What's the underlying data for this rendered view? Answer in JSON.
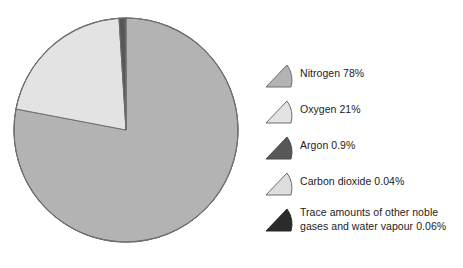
{
  "chart_data": {
    "type": "pie",
    "title": "",
    "subtitle": "",
    "xlabel": "",
    "ylabel": "",
    "grid": false,
    "legend_position": "right",
    "start_angle_deg": 0,
    "direction": "clockwise",
    "units": "%",
    "categories": [
      "Nitrogen",
      "Oxygen",
      "Argon",
      "Carbon dioxide",
      "Trace amounts of other noble gases and water vapour"
    ],
    "values": [
      78,
      21,
      0.9,
      0.04,
      0.06
    ],
    "labels": [
      "Nitrogen 78%",
      "Oxygen 21%",
      "Argon 0.9%",
      "Carbon dioxide 0.04%",
      "Trace amounts of other noble\ngases and water vapour 0.06%"
    ],
    "colors": [
      "#b3b3b3",
      "#e3e3e3",
      "#575757",
      "#dedede",
      "#2b2b2b"
    ],
    "stroke_color": "#6e6e6e",
    "background": "#ffffff"
  },
  "pie": {
    "center_x": 118,
    "center_y": 118,
    "radius": 112,
    "outline_color": "#6e6e6e"
  },
  "legend": {
    "items": [
      {
        "label": "Nitrogen 78%",
        "name": "Nitrogen",
        "value": "78%",
        "color": "#b3b3b3",
        "stroke": "#6e6e6e"
      },
      {
        "label": "Oxygen 21%",
        "name": "Oxygen",
        "value": "21%",
        "color": "#e3e3e3",
        "stroke": "#6e6e6e"
      },
      {
        "label": "Argon 0.9%",
        "name": "Argon",
        "value": "0.9%",
        "color": "#575757",
        "stroke": "#4a4a4a"
      },
      {
        "label": "Carbon dioxide 0.04%",
        "name": "Carbon dioxide",
        "value": "0.04%",
        "color": "#dedede",
        "stroke": "#6e6e6e"
      },
      {
        "label": "Trace amounts of other noble\ngases and water vapour 0.06%",
        "name": "Trace amounts of other noble gases and water vapour",
        "value": "0.06%",
        "color": "#2b2b2b",
        "stroke": "#2b2b2b"
      }
    ]
  }
}
